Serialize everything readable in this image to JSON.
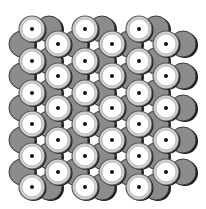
{
  "diagram": {
    "type": "close-packed-lattice",
    "colors": {
      "background": "#ffffff",
      "white_atom_fill": "#ffffff",
      "white_atom_ring": "#d0d0d0",
      "white_atom_outline": "#5a5a5a",
      "center_dot": "#111111",
      "gray_atom_fill": "#8c8c8c",
      "gray_atom_outline": "#3a3a3a",
      "shadow": "#1a1a1a"
    },
    "radius": 13,
    "row_sets": [
      {
        "whites_x": [
          32,
          85,
          139
        ],
        "grays_x": [
          49,
          102,
          156
        ],
        "ys": [
          29,
          61,
          93,
          124,
          156,
          187
        ]
      },
      {
        "whites_x": [
          58,
          112,
          166
        ],
        "grays_x": [
          22,
          75,
          129,
          183
        ],
        "ys": [
          44,
          76,
          108,
          140,
          172
        ]
      }
    ]
  }
}
